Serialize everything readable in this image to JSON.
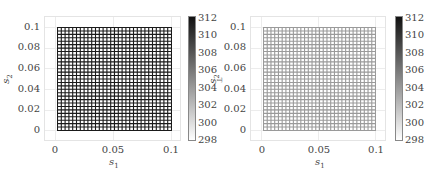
{
  "chart_data": [
    {
      "type": "heatmap",
      "title": "",
      "description": "30x30 finite-element style mesh over [0,0.1]x[0,0.1], cells drawn with dark edges (colored near the top of the colormap, ~310-312)",
      "xlabel": "s1",
      "ylabel": "s2",
      "xticks": [
        "0",
        "0.05",
        "0.1"
      ],
      "yticks": [
        "0",
        "0.02",
        "0.04",
        "0.06",
        "0.08",
        "0.1"
      ],
      "xlim": [
        -0.01,
        0.11
      ],
      "ylim": [
        -0.01,
        0.11
      ],
      "mesh": {
        "nx": 30,
        "ny": 30,
        "x_range": [
          0,
          0.1
        ],
        "y_range": [
          0,
          0.1
        ],
        "edge_color": "#1a1a1a",
        "face_color": "#ffffff"
      },
      "colorbar": {
        "min": 298,
        "max": 312,
        "ticks": [
          "312",
          "310",
          "308",
          "306",
          "304",
          "302",
          "300",
          "298"
        ],
        "colormap": "gray_r",
        "label_clipped": "T"
      },
      "grid": true
    },
    {
      "type": "heatmap",
      "title": "",
      "description": "30x30 mesh over [0,0.1]x[0,0.1], cells drawn with light gray edges (colored near ~302-304)",
      "xlabel": "s1",
      "ylabel": "s2",
      "xticks": [
        "0",
        "0.05",
        "0.1"
      ],
      "yticks": [
        "0",
        "0.02",
        "0.04",
        "0.06",
        "0.08",
        "0.1"
      ],
      "xlim": [
        -0.01,
        0.11
      ],
      "ylim": [
        -0.01,
        0.11
      ],
      "mesh": {
        "nx": 30,
        "ny": 30,
        "x_range": [
          0,
          0.1
        ],
        "y_range": [
          0,
          0.1
        ],
        "edge_color": "#9a9a9a",
        "face_color": "#ffffff"
      },
      "colorbar": {
        "min": 298,
        "max": 312,
        "ticks": [
          "312",
          "310",
          "308",
          "306",
          "304",
          "302",
          "300",
          "298"
        ],
        "colormap": "gray_r"
      },
      "grid": true
    }
  ],
  "left": {
    "xlabel": "s",
    "xlabel_sub": "1",
    "ylabel": "s",
    "ylabel_sub": "2",
    "xticks": [
      "0",
      "0.05",
      "0.1"
    ],
    "yticks": [
      "0.1",
      "0.08",
      "0.06",
      "0.04",
      "0.02",
      "0"
    ],
    "cbar_ticks": [
      "312",
      "310",
      "308",
      "306",
      "304",
      "302",
      "300",
      "298"
    ],
    "cbar_label": "T",
    "edge_color": "#1a1a1a"
  },
  "right": {
    "xlabel": "s",
    "xlabel_sub": "1",
    "ylabel": "s",
    "ylabel_sub": "2",
    "xticks": [
      "0",
      "0.05",
      "0.1"
    ],
    "yticks": [
      "0.1",
      "0.08",
      "0.06",
      "0.04",
      "0.02",
      "0"
    ],
    "cbar_ticks": [
      "312",
      "310",
      "308",
      "306",
      "304",
      "302",
      "300",
      "298"
    ],
    "edge_color": "#9a9a9a"
  }
}
